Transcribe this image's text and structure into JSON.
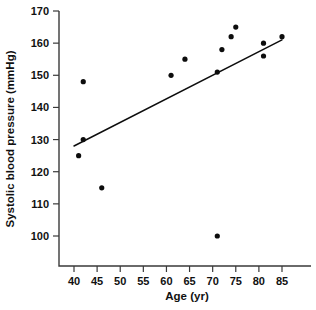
{
  "chart_data": {
    "type": "scatter",
    "title": "",
    "xlabel": "Age (yr)",
    "ylabel": "Systolic blood pressure (mmHg)",
    "xlim": [
      37,
      89
    ],
    "ylim": [
      93,
      170
    ],
    "grid": false,
    "legend": null,
    "x_ticks": [
      40,
      45,
      50,
      55,
      60,
      65,
      70,
      75,
      80,
      85
    ],
    "x_tick_labels": [
      "40",
      "45",
      "50",
      "55",
      "60",
      "65",
      "70",
      "75",
      "80",
      "85"
    ],
    "y_ticks": [
      100,
      110,
      120,
      130,
      140,
      150,
      160,
      170
    ],
    "y_tick_labels": [
      "100",
      "110",
      "120",
      "130",
      "140",
      "150",
      "160",
      "170"
    ],
    "series": [
      {
        "name": "Subjects",
        "marker": "filled-circle",
        "color": "#0d0d0d",
        "x": [
          41,
          42,
          42,
          46,
          61,
          64,
          71,
          71,
          72,
          74,
          75,
          81,
          81,
          85
        ],
        "y": [
          125,
          130,
          148,
          115,
          150,
          155,
          100,
          151,
          158,
          162,
          165,
          156,
          160,
          162
        ],
        "points": [
          {
            "x": 41,
            "y": 125
          },
          {
            "x": 42,
            "y": 130
          },
          {
            "x": 42,
            "y": 148
          },
          {
            "x": 46,
            "y": 115
          },
          {
            "x": 61,
            "y": 150
          },
          {
            "x": 64,
            "y": 155
          },
          {
            "x": 71,
            "y": 100
          },
          {
            "x": 71,
            "y": 151
          },
          {
            "x": 72,
            "y": 158
          },
          {
            "x": 74,
            "y": 162
          },
          {
            "x": 75,
            "y": 165
          },
          {
            "x": 81,
            "y": 156
          },
          {
            "x": 81,
            "y": 160
          },
          {
            "x": 85,
            "y": 162
          }
        ]
      }
    ],
    "fit_line": {
      "name": "regression-line",
      "x": [
        40,
        85
      ],
      "y": [
        128,
        161
      ],
      "color": "#0d0d0d"
    },
    "annotations": []
  }
}
